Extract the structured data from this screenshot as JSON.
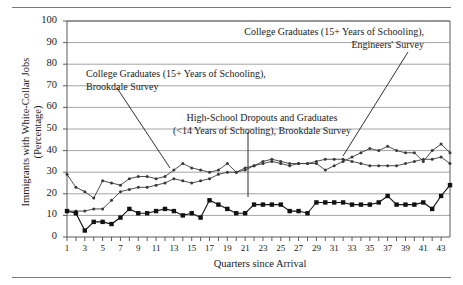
{
  "figure": {
    "has_top_rule": true,
    "has_bottom_rule": true,
    "background": "#ffffff",
    "gridline_color": "#9a9a9a",
    "axis_color": "#5a5a5a",
    "text_color": "#1a1a1a"
  },
  "axes": {
    "ylabel": "Immigrants with White-Collar Jobs\n(Percentage)",
    "xlabel": "Quarters since Arrival",
    "yticks": [
      0,
      10,
      20,
      30,
      40,
      50,
      60,
      70,
      80,
      90,
      100
    ],
    "xticks": [
      1,
      3,
      5,
      7,
      9,
      11,
      13,
      15,
      17,
      19,
      21,
      23,
      25,
      27,
      29,
      31,
      33,
      35,
      37,
      39,
      41,
      43
    ]
  },
  "annotations": [
    {
      "id": "engineers-college-grads",
      "text": "College Graduates (15+ Years of Schooling),\nEngineers' Survey",
      "leader": {
        "x1": 408,
        "y1": 52,
        "x2": 343,
        "y2": 156
      }
    },
    {
      "id": "brookdale-college-grads",
      "text": "College Graduates (15+ Years of Schooling),\nBrookdale Survey",
      "leader": {
        "x1": 117,
        "y1": 88,
        "x2": 170,
        "y2": 168
      }
    },
    {
      "id": "brookdale-highschool",
      "text": "High-School Dropouts and Graduates\n(<14 Years of Schooling), Brookdale Survey",
      "leader": {
        "x1": 248,
        "y1": 132,
        "x2": 248,
        "y2": 197
      }
    }
  ],
  "chart_data": {
    "type": "line",
    "title": "",
    "xlabel": "Quarters since Arrival",
    "ylabel": "Immigrants with White-Collar Jobs (Percentage)",
    "xlim": [
      1,
      44
    ],
    "ylim": [
      0,
      100
    ],
    "grid": "horizontal",
    "legend": "annotations-inline",
    "x": [
      1,
      2,
      3,
      4,
      5,
      6,
      7,
      8,
      9,
      10,
      11,
      12,
      13,
      14,
      15,
      16,
      17,
      18,
      19,
      20,
      21,
      22,
      23,
      24,
      25,
      26,
      27,
      28,
      29,
      30,
      31,
      32,
      33,
      34,
      35,
      36,
      37,
      38,
      39,
      40,
      41,
      42,
      43,
      44
    ],
    "series": [
      {
        "name": "College Graduates (15+ Years of Schooling), Engineers' Survey",
        "marker": "small-dot",
        "color": "#3a3a3a",
        "values": [
          29,
          23,
          21,
          18,
          26,
          25,
          24,
          27,
          28,
          28,
          27,
          28,
          31,
          34,
          32,
          31,
          30,
          31,
          34,
          30,
          31,
          33,
          35,
          36,
          35,
          34,
          34,
          34,
          34,
          31,
          33,
          35,
          37,
          39,
          41,
          40,
          42,
          40,
          39,
          39,
          35,
          40,
          43,
          39
        ]
      },
      {
        "name": "College Graduates (15+ Years of Schooling), Brookdale Survey",
        "marker": "small-dot",
        "color": "#3a3a3a",
        "values": [
          12,
          12,
          12,
          13,
          13,
          17,
          21,
          22,
          23,
          23,
          24,
          25,
          27,
          26,
          25,
          26,
          27,
          29,
          30,
          30,
          32,
          33,
          34,
          35,
          34,
          33,
          34,
          34,
          35,
          36,
          36,
          36,
          35,
          34,
          33,
          33,
          33,
          33,
          34,
          35,
          36,
          36,
          37,
          34
        ]
      },
      {
        "name": "High-School Dropouts and Graduates (<14 Years of Schooling), Brookdale Survey",
        "marker": "filled-square",
        "color": "#111111",
        "values": [
          12,
          11,
          3,
          7,
          7,
          6,
          9,
          13,
          11,
          11,
          12,
          13,
          12,
          10,
          11,
          9,
          17,
          15,
          13,
          11,
          11,
          15,
          15,
          15,
          15,
          12,
          12,
          11,
          16,
          16,
          16,
          16,
          15,
          15,
          15,
          16,
          19,
          15,
          15,
          15,
          16,
          13,
          19,
          24
        ]
      }
    ]
  }
}
